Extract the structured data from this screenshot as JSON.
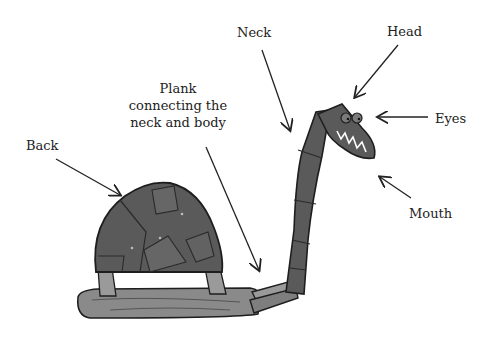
{
  "diagram": {
    "labels": {
      "neck": "Neck",
      "head": "Head",
      "eyes": "Eyes",
      "mouth": "Mouth",
      "back": "Back",
      "plank_line1": "Plank",
      "plank_line2": "connecting the",
      "plank_line3": "neck and body"
    },
    "colors": {
      "metal": "#5a5a5a",
      "metal_dark": "#3c3c3c",
      "wood": "#8a8a8a",
      "outline": "#1e1e1e",
      "arrow": "#222222"
    }
  }
}
